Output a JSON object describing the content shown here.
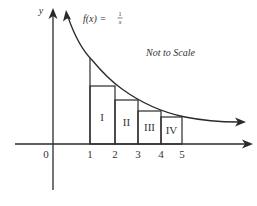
{
  "function_label": {
    "lhs": "f(x) =",
    "numerator": "1",
    "denominator": "x"
  },
  "y_axis_label": "y",
  "origin_label": "0",
  "note": "Not to Scale",
  "x_ticks": [
    "1",
    "2",
    "3",
    "4",
    "5"
  ],
  "rectangles": [
    {
      "label": "I",
      "from": 1,
      "to": 2
    },
    {
      "label": "II",
      "from": 2,
      "to": 3
    },
    {
      "label": "III",
      "from": 3,
      "to": 4
    },
    {
      "label": "IV",
      "from": 4,
      "to": 5
    }
  ],
  "colors": {
    "line": "#2a2a2a",
    "text": "#333333",
    "background": "#ffffff"
  }
}
